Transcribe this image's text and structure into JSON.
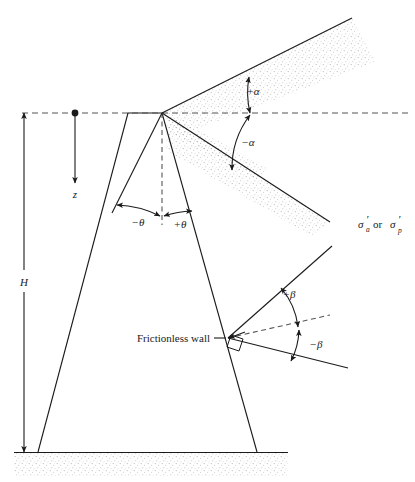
{
  "figure": {
    "type": "engineering-diagram",
    "background_color": "#ffffff",
    "line_color": "#1a1a1a",
    "stipple_color": "#b9b9b9",
    "dash_color": "#555555"
  },
  "labels": {
    "height": "H",
    "depth": "z",
    "alpha_positive": "+α",
    "alpha_negative": "−α",
    "beta_positive": "+β",
    "beta_negative": "−β",
    "theta_positive": "+θ",
    "theta_negative": "−θ",
    "wall": "Frictionless wall",
    "stress_sigma": "σ",
    "stress_prime": "′",
    "stress_sub_a": "a",
    "stress_sub_p": "p",
    "stress_or": "or",
    "stress_full": "σ′a or σ′p"
  },
  "geometry": {
    "apex": {
      "x": 162,
      "y": 113
    },
    "surface_line_y": 113,
    "ground_line_y": 452,
    "wall_left_top": {
      "x": 128,
      "y": 113
    },
    "wall_left_bottom": {
      "x": 38,
      "y": 452
    },
    "wall_right_top": {
      "x": 162,
      "y": 113
    },
    "wall_right_bottom": {
      "x": 257,
      "y": 452
    },
    "wall_contact_point": {
      "x": 228,
      "y": 338
    },
    "upslope_end": {
      "x": 352,
      "y": 18
    },
    "downslope_end": {
      "x": 330,
      "y": 222
    },
    "theta_left_ray_end": {
      "x": 112,
      "y": 213
    },
    "beta_plus_ray_end": {
      "x": 330,
      "y": 248
    },
    "beta_minus_ray_end": {
      "x": 348,
      "y": 368
    },
    "z_arrow_top": {
      "x": 75,
      "y": 113
    },
    "z_arrow_bottom": {
      "x": 75,
      "y": 185
    },
    "h_dim_x": 24
  }
}
